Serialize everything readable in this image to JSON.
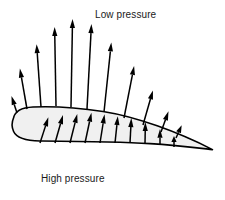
{
  "figure": {
    "title_low": "Low pressure",
    "title_high": "High pressure",
    "background_color": "#ffffff",
    "text_color": "#1a1a1a"
  },
  "airfoil": {
    "name": "airfoil-cross-section",
    "fill_color": "#f0f0f0",
    "stroke_color": "#000000",
    "stroke_width": 1.6,
    "leading_edge": {
      "x": 12,
      "y": 125
    },
    "trailing_edge": {
      "x": 213,
      "y": 150
    },
    "outline_path": "M 13.5 118 C 15 110.5, 23 107.5, 33 107.0 C 52 106.2, 78 107.6, 103 111.5 C 136 116.6, 178 132.0, 212.5 149.6 C 200 148.2, 176 145.2, 150 143.6 C 118 141.7, 72 141.3, 40 141.0 C 26 140.8, 16.5 138.0, 13.6 131.5 C 11.6 127.0, 11.8 122.0, 13.5 118 Z"
  },
  "arrow_style": {
    "shaft_color": "#000000",
    "shaft_width": 1.5,
    "head_length": 9,
    "head_half_width": 2.6
  },
  "upper_arrows": {
    "label": "low-pressure-suction-arrows",
    "direction": "outward from upper surface",
    "items": [
      {
        "x": 17,
        "y": 113,
        "angle": -108,
        "length": 18
      },
      {
        "x": 27,
        "y": 109,
        "angle": -100,
        "length": 41
      },
      {
        "x": 41,
        "y": 107,
        "angle": -94,
        "length": 63
      },
      {
        "x": 56,
        "y": 106,
        "angle": -91,
        "length": 79
      },
      {
        "x": 71,
        "y": 107,
        "angle": -89,
        "length": 88
      },
      {
        "x": 87,
        "y": 109,
        "angle": -87,
        "length": 85
      },
      {
        "x": 104,
        "y": 112,
        "angle": -84,
        "length": 70
      },
      {
        "x": 124,
        "y": 118,
        "angle": -79,
        "length": 53
      },
      {
        "x": 143,
        "y": 125,
        "angle": -74,
        "length": 36
      },
      {
        "x": 161,
        "y": 132,
        "angle": -70,
        "length": 22
      },
      {
        "x": 176,
        "y": 138,
        "angle": -66,
        "length": 14
      }
    ]
  },
  "lower_arrows": {
    "label": "high-pressure-lift-arrows",
    "direction": "inward toward lower surface",
    "items": [
      {
        "x": 40,
        "y": 143,
        "angle": -72,
        "length": 27
      },
      {
        "x": 55,
        "y": 143,
        "angle": -74,
        "length": 29
      },
      {
        "x": 70,
        "y": 143,
        "angle": -76,
        "length": 30
      },
      {
        "x": 85,
        "y": 143,
        "angle": -78,
        "length": 31
      },
      {
        "x": 100,
        "y": 143,
        "angle": -81,
        "length": 29
      },
      {
        "x": 115,
        "y": 143,
        "angle": -84,
        "length": 27
      },
      {
        "x": 130,
        "y": 143,
        "angle": -87,
        "length": 25
      },
      {
        "x": 145,
        "y": 144,
        "angle": -89,
        "length": 22
      },
      {
        "x": 160,
        "y": 145,
        "angle": -90,
        "length": 16
      },
      {
        "x": 174,
        "y": 147,
        "angle": -90,
        "length": 11
      }
    ]
  }
}
